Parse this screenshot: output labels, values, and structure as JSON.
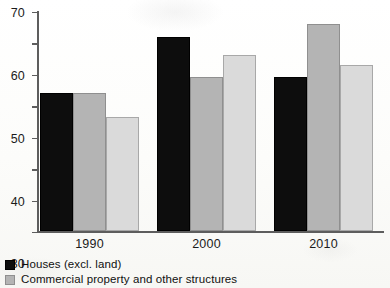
{
  "chart_data": {
    "type": "bar",
    "title": "",
    "subtitle": "",
    "xlabel": "",
    "ylabel": "",
    "categories": [
      "1990",
      "2000",
      "2010"
    ],
    "series": [
      {
        "name": "Houses (excl. land)",
        "color": "#0d0d0d",
        "values": [
          44,
          62,
          49
        ]
      },
      {
        "name": "Commercial property and other structures",
        "color": "#b4b4b4",
        "values": [
          44,
          49,
          66
        ]
      },
      {
        "name": "",
        "color": "#dadada",
        "values": [
          36.5,
          56,
          53
        ]
      }
    ],
    "ylim": [
      0,
      70
    ],
    "yticks": [
      0,
      10,
      20,
      30,
      40,
      50,
      60,
      70
    ],
    "ytick_labels": [
      "0",
      "10",
      "20",
      "30",
      "40",
      "50",
      "60",
      "70"
    ],
    "grid": false,
    "legend_position": "bottom-left",
    "legend_entries": [
      {
        "label": "Houses (excl. land)",
        "color": "#0d0d0d"
      },
      {
        "label": "Commercial property and other structures",
        "color": "#b4b4b4"
      }
    ]
  },
  "colors": {
    "background": "#fdfdfb",
    "axis": "#5d5d5d",
    "text": "#1b1b1b",
    "series_black": "#0d0d0d",
    "series_mid_grey": "#b4b4b4",
    "series_light_grey": "#dadada"
  }
}
